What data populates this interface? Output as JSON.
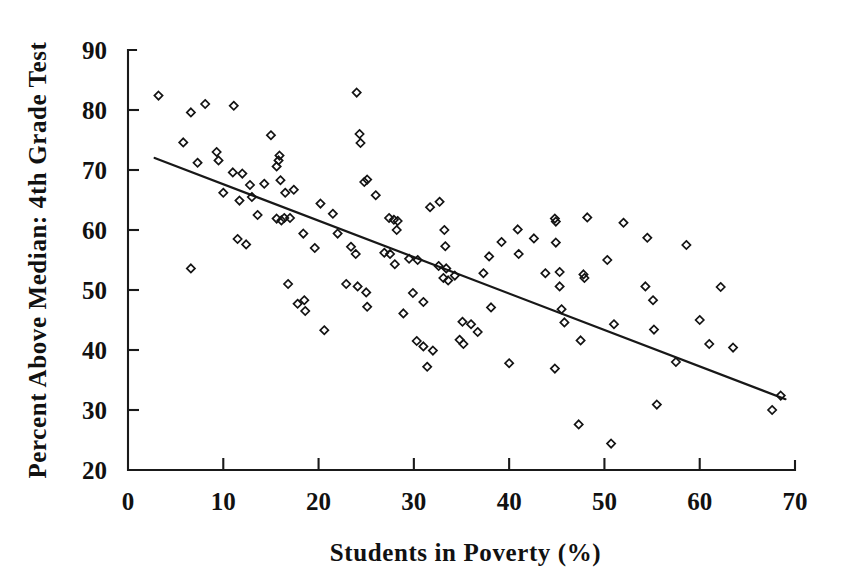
{
  "chart_data": {
    "type": "scatter",
    "title": "",
    "xlabel": "Students in Poverty (%)",
    "ylabel": "Percent Above Median: 4th Grade Test",
    "xlim": [
      0,
      70
    ],
    "ylim": [
      20,
      90
    ],
    "xticks": [
      0,
      10,
      20,
      30,
      40,
      50,
      60,
      70
    ],
    "yticks": [
      20,
      30,
      40,
      50,
      60,
      70,
      80,
      90
    ],
    "grid": false,
    "legend": "none",
    "marker": "open-diamond",
    "marker_color": "#131313",
    "line_color": "#181818",
    "trendline": {
      "type": "linear",
      "x_start": 2.8,
      "y_start": 72.0,
      "x_end": 69.0,
      "y_end": 31.8,
      "slope": -0.607,
      "intercept": 73.7
    },
    "points": [
      {
        "x": 3.2,
        "y": 82.4
      },
      {
        "x": 6.6,
        "y": 79.6
      },
      {
        "x": 8.1,
        "y": 81.0
      },
      {
        "x": 11.1,
        "y": 80.7
      },
      {
        "x": 5.8,
        "y": 74.6
      },
      {
        "x": 9.3,
        "y": 73.0
      },
      {
        "x": 9.5,
        "y": 71.6
      },
      {
        "x": 7.3,
        "y": 71.2
      },
      {
        "x": 11.0,
        "y": 69.6
      },
      {
        "x": 12.0,
        "y": 69.4
      },
      {
        "x": 6.6,
        "y": 53.6
      },
      {
        "x": 10.0,
        "y": 66.2
      },
      {
        "x": 11.7,
        "y": 64.9
      },
      {
        "x": 13.0,
        "y": 65.5
      },
      {
        "x": 12.8,
        "y": 67.5
      },
      {
        "x": 15.0,
        "y": 75.8
      },
      {
        "x": 14.3,
        "y": 67.7
      },
      {
        "x": 15.8,
        "y": 71.6
      },
      {
        "x": 15.9,
        "y": 72.4
      },
      {
        "x": 15.6,
        "y": 70.6
      },
      {
        "x": 16.0,
        "y": 68.3
      },
      {
        "x": 24.0,
        "y": 82.9
      },
      {
        "x": 16.5,
        "y": 66.2
      },
      {
        "x": 17.4,
        "y": 66.7
      },
      {
        "x": 13.6,
        "y": 62.5
      },
      {
        "x": 15.6,
        "y": 61.9
      },
      {
        "x": 16.1,
        "y": 61.6
      },
      {
        "x": 16.4,
        "y": 62.0
      },
      {
        "x": 17.0,
        "y": 62.0
      },
      {
        "x": 18.4,
        "y": 59.4
      },
      {
        "x": 19.6,
        "y": 57.0
      },
      {
        "x": 16.8,
        "y": 51.0
      },
      {
        "x": 17.8,
        "y": 47.7
      },
      {
        "x": 18.5,
        "y": 48.3
      },
      {
        "x": 18.6,
        "y": 46.5
      },
      {
        "x": 20.6,
        "y": 43.3
      },
      {
        "x": 11.5,
        "y": 58.5
      },
      {
        "x": 12.4,
        "y": 57.6
      },
      {
        "x": 20.2,
        "y": 64.4
      },
      {
        "x": 21.5,
        "y": 62.7
      },
      {
        "x": 22.0,
        "y": 59.4
      },
      {
        "x": 23.4,
        "y": 57.2
      },
      {
        "x": 23.9,
        "y": 56.0
      },
      {
        "x": 24.3,
        "y": 76.0
      },
      {
        "x": 24.4,
        "y": 74.5
      },
      {
        "x": 24.8,
        "y": 68.0
      },
      {
        "x": 25.1,
        "y": 68.4
      },
      {
        "x": 26.0,
        "y": 65.8
      },
      {
        "x": 24.1,
        "y": 50.6
      },
      {
        "x": 25.0,
        "y": 49.6
      },
      {
        "x": 25.1,
        "y": 47.2
      },
      {
        "x": 22.9,
        "y": 51.0
      },
      {
        "x": 27.4,
        "y": 62.0
      },
      {
        "x": 27.9,
        "y": 61.7
      },
      {
        "x": 28.3,
        "y": 61.5
      },
      {
        "x": 28.2,
        "y": 60.0
      },
      {
        "x": 27.5,
        "y": 56.0
      },
      {
        "x": 26.9,
        "y": 56.2
      },
      {
        "x": 28.0,
        "y": 54.3
      },
      {
        "x": 29.5,
        "y": 55.2
      },
      {
        "x": 30.4,
        "y": 55.0
      },
      {
        "x": 29.9,
        "y": 49.5
      },
      {
        "x": 31.0,
        "y": 48.0
      },
      {
        "x": 28.9,
        "y": 46.1
      },
      {
        "x": 30.3,
        "y": 41.5
      },
      {
        "x": 31.0,
        "y": 40.6
      },
      {
        "x": 32.0,
        "y": 39.9
      },
      {
        "x": 31.4,
        "y": 37.2
      },
      {
        "x": 31.7,
        "y": 63.8
      },
      {
        "x": 32.7,
        "y": 64.7
      },
      {
        "x": 33.2,
        "y": 60.0
      },
      {
        "x": 33.3,
        "y": 57.3
      },
      {
        "x": 32.6,
        "y": 54.0
      },
      {
        "x": 33.4,
        "y": 53.6
      },
      {
        "x": 33.1,
        "y": 52.0
      },
      {
        "x": 33.6,
        "y": 51.6
      },
      {
        "x": 34.3,
        "y": 52.4
      },
      {
        "x": 34.8,
        "y": 41.7
      },
      {
        "x": 35.2,
        "y": 41.0
      },
      {
        "x": 35.1,
        "y": 44.7
      },
      {
        "x": 36.0,
        "y": 44.3
      },
      {
        "x": 36.7,
        "y": 43.0
      },
      {
        "x": 37.3,
        "y": 52.8
      },
      {
        "x": 37.9,
        "y": 55.6
      },
      {
        "x": 38.1,
        "y": 47.1
      },
      {
        "x": 39.2,
        "y": 58.0
      },
      {
        "x": 40.9,
        "y": 60.1
      },
      {
        "x": 41.0,
        "y": 56.0
      },
      {
        "x": 40.0,
        "y": 37.8
      },
      {
        "x": 42.6,
        "y": 58.6
      },
      {
        "x": 43.8,
        "y": 52.8
      },
      {
        "x": 44.8,
        "y": 61.9
      },
      {
        "x": 44.9,
        "y": 61.4
      },
      {
        "x": 44.9,
        "y": 57.9
      },
      {
        "x": 45.3,
        "y": 53.0
      },
      {
        "x": 45.5,
        "y": 46.8
      },
      {
        "x": 45.3,
        "y": 50.6
      },
      {
        "x": 45.8,
        "y": 44.6
      },
      {
        "x": 44.8,
        "y": 36.9
      },
      {
        "x": 48.2,
        "y": 62.1
      },
      {
        "x": 47.8,
        "y": 52.6
      },
      {
        "x": 47.9,
        "y": 52.0
      },
      {
        "x": 47.5,
        "y": 41.6
      },
      {
        "x": 47.3,
        "y": 27.6
      },
      {
        "x": 50.7,
        "y": 24.4
      },
      {
        "x": 50.3,
        "y": 55.0
      },
      {
        "x": 51.0,
        "y": 44.3
      },
      {
        "x": 52.0,
        "y": 61.2
      },
      {
        "x": 54.5,
        "y": 58.7
      },
      {
        "x": 54.3,
        "y": 50.6
      },
      {
        "x": 55.1,
        "y": 48.3
      },
      {
        "x": 55.2,
        "y": 43.4
      },
      {
        "x": 55.5,
        "y": 30.9
      },
      {
        "x": 58.6,
        "y": 57.5
      },
      {
        "x": 57.5,
        "y": 38.0
      },
      {
        "x": 60.0,
        "y": 45.0
      },
      {
        "x": 61.0,
        "y": 41.0
      },
      {
        "x": 62.2,
        "y": 50.5
      },
      {
        "x": 63.5,
        "y": 40.4
      },
      {
        "x": 67.6,
        "y": 30.0
      },
      {
        "x": 68.5,
        "y": 32.4
      }
    ]
  }
}
